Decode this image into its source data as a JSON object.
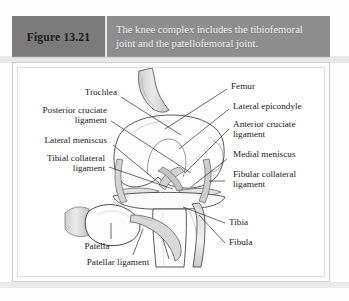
{
  "figure": {
    "number_label": "Figure 13.21",
    "caption": "The knee complex includes the tibiofemoral joint and the patellofemoral joint."
  },
  "colors": {
    "header_bar": "#8e8e8e",
    "label_box": "#7b7b7b",
    "caption_text": "#f2f2f2",
    "panel_background": "#ffffff",
    "panel_border": "#cfcfcf",
    "bone_fill": "#d8d8d8",
    "outline": "#2a2a2a"
  },
  "illustration": {
    "title": "knee-complex-anterior-view",
    "labels": [
      {
        "id": "trochlea",
        "text": "Trochlea"
      },
      {
        "id": "posterior-cruciate",
        "line1": "Posterior cruciate",
        "line2": "ligament"
      },
      {
        "id": "lateral-meniscus",
        "text": "Lateral meniscus"
      },
      {
        "id": "tibial-collateral",
        "line1": "Tibial collateral",
        "line2": "ligament"
      },
      {
        "id": "patella",
        "text": "Patella"
      },
      {
        "id": "patellar-ligament",
        "text": "Patellar ligament"
      },
      {
        "id": "femur",
        "text": "Femur"
      },
      {
        "id": "lateral-epicondyle",
        "text": "Lateral epicondyle"
      },
      {
        "id": "anterior-cruciate",
        "line1": "Anterior cruciate",
        "line2": "ligament"
      },
      {
        "id": "medial-meniscus",
        "text": "Medial meniscus"
      },
      {
        "id": "fibular-collateral",
        "line1": "Fibular collateral",
        "line2": "ligament"
      },
      {
        "id": "tibia",
        "text": "Tibia"
      },
      {
        "id": "fibula",
        "text": "Fibula"
      }
    ]
  }
}
